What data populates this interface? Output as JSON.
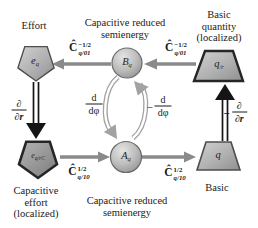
{
  "labels": {
    "effort": "Effort",
    "top_semienergy_line1": "Capacitive reduced",
    "top_semienergy_line2": "semienergy",
    "basic_quantity_line1": "Basic",
    "basic_quantity_line2": "quantity",
    "basic_quantity_line3": "(localized)",
    "cap_effort_line1": "Capacitive",
    "cap_effort_line2": "effort",
    "cap_effort_line3": "(localized)",
    "bottom_semienergy_line1": "Capacitive reduced",
    "bottom_semienergy_line2": "semienergy",
    "basic": "Basic"
  },
  "nodes": {
    "effort": {
      "base": "e",
      "sub": "q"
    },
    "semienergy_b": {
      "base": "B",
      "sub": "q"
    },
    "basic_quantity_localized": {
      "base": "q",
      "sub": "/r"
    },
    "capacitive_effort_localized": {
      "base": "e",
      "sub": "q/rC"
    },
    "semienergy_a": {
      "base": "A",
      "sub": "q"
    },
    "basic_quantity": {
      "base": "q",
      "sub": ""
    }
  },
  "operators": {
    "c_q01_left": {
      "base": "Ĉ",
      "sup": "−1/2",
      "sub": "q/01"
    },
    "c_q01_right": {
      "base": "Ĉ",
      "sup": "−1/2",
      "sub": "q/01"
    },
    "c_q10_left": {
      "base": "Ĉ",
      "sup": "1/2",
      "sub": "q/10"
    },
    "c_q10_right": {
      "base": "Ĉ",
      "sup": "1/2",
      "sub": "q/10"
    },
    "space_derivative": {
      "sign": "",
      "num": "∂",
      "den": "∂r"
    },
    "space_derivative_negative": {
      "sign": "−",
      "num": "∂",
      "den": "∂r"
    },
    "phase_derivative": {
      "sign": "",
      "num": "d",
      "den": "dφ"
    },
    "phase_derivative_negative": {
      "sign": "−",
      "num": "d",
      "den": "dφ"
    }
  },
  "colors": {
    "background": "#ffffff",
    "arrow_gray": "#8a8a8a",
    "band_gray": "#a2a2a2",
    "arrow_black": "#151515",
    "shape_border_dark": "#262626",
    "shape_border": "#4d4d4d",
    "text": "#1a1a1a"
  }
}
